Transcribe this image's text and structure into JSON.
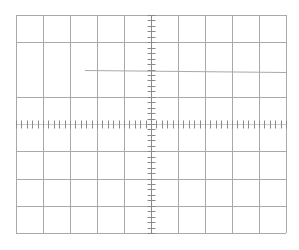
{
  "graticule": {
    "type": "oscilloscope-graticule",
    "columns": 10,
    "rows": 8,
    "minor_divisions_per_major": 5,
    "origin": {
      "x": 16,
      "y": 15
    },
    "cell_width": 27,
    "cell_height": 27.25,
    "center": {
      "x": 151,
      "y": 124
    },
    "line_color": "#a9a9a9",
    "tick_color": "#8a8a8a",
    "background": "#ffffff",
    "partial_line": {
      "y": 70,
      "x_start": 85,
      "x_end": 286
    }
  }
}
